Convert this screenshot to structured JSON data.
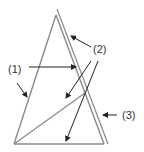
{
  "diagram": {
    "labels": [
      {
        "id": "1",
        "text": "(1)"
      },
      {
        "id": "2",
        "text": "(2)"
      },
      {
        "id": "3",
        "text": "(3)"
      }
    ],
    "colors": {
      "line": "#8a8a8a",
      "arrow": "#222222",
      "text": "#333333"
    }
  }
}
